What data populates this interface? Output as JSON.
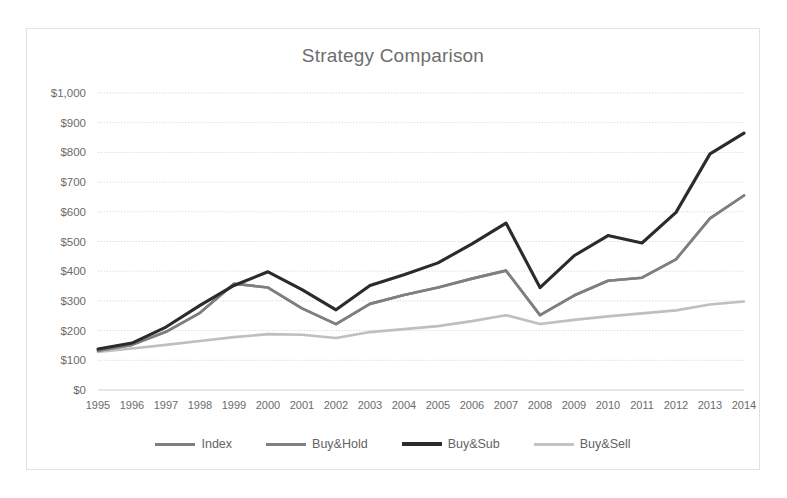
{
  "chart_data": {
    "type": "line",
    "title": "Strategy Comparison",
    "xlabel": "",
    "ylabel": "",
    "grid": true,
    "legend_position": "bottom",
    "ylim": [
      0,
      1000
    ],
    "ytick_labels": [
      "$1,000",
      "$900",
      "$800",
      "$700",
      "$600",
      "$500",
      "$400",
      "$300",
      "$200",
      "$100",
      "$0"
    ],
    "ytick_values": [
      1000,
      900,
      800,
      700,
      600,
      500,
      400,
      300,
      200,
      100,
      0
    ],
    "categories": [
      "1995",
      "1996",
      "1997",
      "1998",
      "1999",
      "2000",
      "2001",
      "2002",
      "2003",
      "2004",
      "2005",
      "2006",
      "2007",
      "2008",
      "2009",
      "2010",
      "2011",
      "2012",
      "2013",
      "2014"
    ],
    "series": [
      {
        "name": "Index",
        "color": "#7f7f7f",
        "width": 2.6,
        "values": [
          132,
          152,
          196,
          260,
          358,
          345,
          275,
          222,
          290,
          320,
          345,
          375,
          402,
          252,
          318,
          368,
          378,
          440,
          578,
          655
        ]
      },
      {
        "name": "Buy&Hold",
        "color": "#7f7f7f",
        "width": 2.6,
        "values": [
          132,
          152,
          196,
          260,
          358,
          345,
          275,
          222,
          290,
          320,
          345,
          375,
          402,
          252,
          318,
          368,
          378,
          440,
          578,
          655
        ]
      },
      {
        "name": "Buy&Sub",
        "color": "#2b2b2b",
        "width": 3.1,
        "values": [
          138,
          158,
          212,
          285,
          352,
          398,
          338,
          270,
          352,
          388,
          428,
          492,
          562,
          345,
          452,
          520,
          495,
          598,
          795,
          865
        ]
      },
      {
        "name": "Buy&Sell",
        "color": "#bfbfbf",
        "width": 2.6,
        "values": [
          128,
          140,
          152,
          165,
          178,
          188,
          186,
          175,
          195,
          205,
          215,
          232,
          252,
          222,
          236,
          248,
          258,
          268,
          288,
          298
        ]
      }
    ]
  },
  "legend": {
    "items": [
      {
        "label": "Index",
        "color": "#7f7f7f",
        "width": 3
      },
      {
        "label": "Buy&Hold",
        "color": "#808080",
        "width": 3
      },
      {
        "label": "Buy&Sub",
        "color": "#2b2b2b",
        "width": 4
      },
      {
        "label": "Buy&Sell",
        "color": "#c4c4c4",
        "width": 3
      }
    ]
  }
}
